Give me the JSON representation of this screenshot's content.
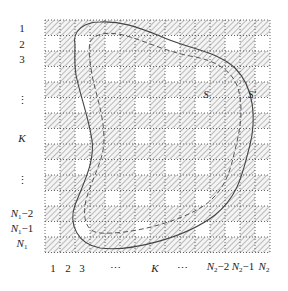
{
  "figure": {
    "grid": {
      "rows": 15,
      "cols": 15,
      "origin_x": 45,
      "origin_y": 20,
      "cell_w": 15,
      "cell_h": 15.5,
      "hatch_color": "#9a9a9a",
      "grid_line_color": "#555555",
      "white_cells": [
        [
          2,
          1
        ],
        [
          2,
          3
        ],
        [
          2,
          5
        ],
        [
          2,
          9
        ],
        [
          2,
          13
        ],
        [
          2,
          15
        ],
        [
          4,
          1
        ],
        [
          4,
          5
        ],
        [
          4,
          7
        ],
        [
          4,
          9
        ],
        [
          4,
          11
        ],
        [
          4,
          15
        ],
        [
          6,
          1
        ],
        [
          6,
          3
        ],
        [
          6,
          7
        ],
        [
          6,
          9
        ],
        [
          6,
          11
        ],
        [
          6,
          15
        ],
        [
          8,
          1
        ],
        [
          8,
          3
        ],
        [
          8,
          7
        ],
        [
          8,
          9
        ],
        [
          8,
          11
        ],
        [
          8,
          15
        ],
        [
          10,
          1
        ],
        [
          10,
          3
        ],
        [
          10,
          7
        ],
        [
          10,
          9
        ],
        [
          10,
          11
        ],
        [
          10,
          15
        ],
        [
          12,
          1
        ],
        [
          12,
          5
        ],
        [
          12,
          7
        ],
        [
          12,
          9
        ],
        [
          12,
          11
        ],
        [
          12,
          15
        ],
        [
          14,
          1
        ],
        [
          14,
          3
        ],
        [
          14,
          7
        ],
        [
          14,
          11
        ],
        [
          14,
          13
        ],
        [
          14,
          15
        ]
      ]
    },
    "row_labels": [
      {
        "text": "1",
        "y": 28
      },
      {
        "text": "2",
        "y": 44
      },
      {
        "text": "3",
        "y": 59
      },
      {
        "text": "⋮",
        "y": 100
      },
      {
        "text": "K",
        "y": 138,
        "italic": true
      },
      {
        "text": "⋮",
        "y": 180
      },
      {
        "text": "N",
        "sub": "1",
        "suffix": "−2",
        "y": 215,
        "italic": true
      },
      {
        "text": "N",
        "sub": "1",
        "suffix": "−1",
        "y": 230,
        "italic": true
      },
      {
        "text": "N",
        "sub": "1",
        "suffix": "",
        "y": 245,
        "italic": true
      }
    ],
    "col_labels": [
      {
        "text": "1",
        "x": 53
      },
      {
        "text": "2",
        "x": 68
      },
      {
        "text": "3",
        "x": 82
      },
      {
        "text": "⋯",
        "x": 115
      },
      {
        "text": "K",
        "x": 155,
        "italic": true
      },
      {
        "text": "⋯",
        "x": 182
      },
      {
        "text": "N",
        "sub": "2",
        "suffix": "−2",
        "x": 218,
        "italic": true
      },
      {
        "text": "N",
        "sub": "2",
        "suffix": "−1",
        "x": 243,
        "italic": true
      },
      {
        "text": "N",
        "sub": "2",
        "suffix": "",
        "x": 264,
        "italic": true
      }
    ],
    "row_label_x": 22,
    "col_label_y": 268,
    "curves": {
      "S": {
        "label": "S",
        "style": "dashed",
        "label_x": 206,
        "label_y": 94
      },
      "S_prime": {
        "label": "S′",
        "style": "solid",
        "label_x": 252,
        "label_y": 94
      }
    }
  }
}
